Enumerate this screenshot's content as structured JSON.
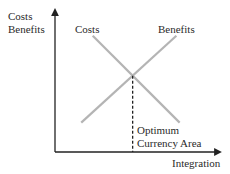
{
  "chart_data": {
    "type": "line",
    "title": "",
    "ylabel": [
      "Costs",
      "Benefits"
    ],
    "xlabel": "Integration",
    "grid": false,
    "x_range": [
      0,
      10
    ],
    "y_range": [
      0,
      10
    ],
    "series": [
      {
        "name": "Costs",
        "points": [
          [
            2.3,
            8.3
          ],
          [
            7.6,
            2.1
          ]
        ],
        "color": "#b4b4b4"
      },
      {
        "name": "Benefits",
        "points": [
          [
            1.6,
            2.1
          ],
          [
            7.4,
            8.3
          ]
        ],
        "color": "#b4b4b4"
      }
    ],
    "annotations": [
      {
        "text": [
          "Optimum",
          "Currency Area"
        ],
        "x": 4.8,
        "note": "dashed vertical line from the intersection down to the x-axis"
      }
    ]
  }
}
